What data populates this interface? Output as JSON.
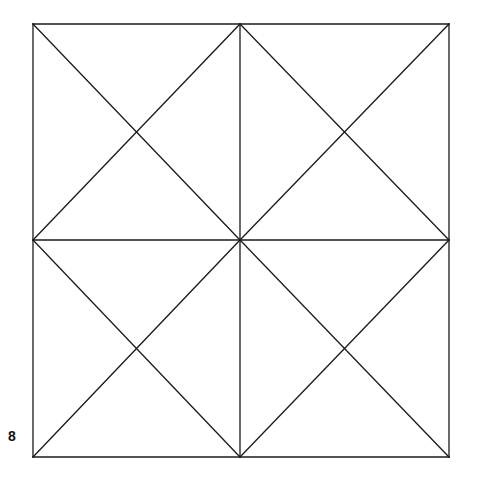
{
  "figure": {
    "label": "8",
    "stroke_color": "#1a1a1a",
    "background_color": "#ffffff",
    "outer_square": {
      "x1": 33,
      "y1": 24,
      "x2": 449,
      "y2": 457
    },
    "center": {
      "x": 240,
      "y": 240
    },
    "lines": [
      {
        "name": "outer-top",
        "x1": 33,
        "y1": 24,
        "x2": 449,
        "y2": 24
      },
      {
        "name": "outer-bottom",
        "x1": 33,
        "y1": 457,
        "x2": 449,
        "y2": 457
      },
      {
        "name": "outer-left",
        "x1": 33,
        "y1": 24,
        "x2": 33,
        "y2": 457
      },
      {
        "name": "outer-right",
        "x1": 449,
        "y1": 24,
        "x2": 449,
        "y2": 457
      },
      {
        "name": "mid-vertical",
        "x1": 240,
        "y1": 24,
        "x2": 240,
        "y2": 457
      },
      {
        "name": "mid-horizontal",
        "x1": 33,
        "y1": 240,
        "x2": 449,
        "y2": 240
      },
      {
        "name": "q1-diag-a",
        "x1": 33,
        "y1": 24,
        "x2": 240,
        "y2": 240
      },
      {
        "name": "q1-diag-b",
        "x1": 240,
        "y1": 24,
        "x2": 33,
        "y2": 240
      },
      {
        "name": "q2-diag-a",
        "x1": 240,
        "y1": 24,
        "x2": 449,
        "y2": 240
      },
      {
        "name": "q2-diag-b",
        "x1": 449,
        "y1": 24,
        "x2": 240,
        "y2": 240
      },
      {
        "name": "q3-diag-a",
        "x1": 33,
        "y1": 240,
        "x2": 240,
        "y2": 457
      },
      {
        "name": "q3-diag-b",
        "x1": 240,
        "y1": 240,
        "x2": 33,
        "y2": 457
      },
      {
        "name": "q4-diag-a",
        "x1": 240,
        "y1": 240,
        "x2": 449,
        "y2": 457
      },
      {
        "name": "q4-diag-b",
        "x1": 449,
        "y1": 240,
        "x2": 240,
        "y2": 457
      }
    ]
  }
}
